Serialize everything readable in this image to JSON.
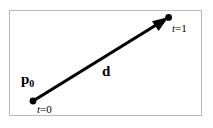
{
  "figure": {
    "type": "vector-ray-diagram",
    "frame": {
      "border_color": "#b9b9bd",
      "background_color": "#ffffff"
    },
    "stroke_color": "#000000",
    "labels": {
      "origin_point": "p",
      "origin_subscript": "0",
      "direction_vector": "d",
      "parameter_start": "t",
      "parameter_start_equals": "=0",
      "parameter_end": "t",
      "parameter_end_equals": "=1"
    },
    "geometry": {
      "start_point": {
        "x": 33,
        "y": 101
      },
      "end_point": {
        "x": 168,
        "y": 18
      },
      "line_width": 3
    }
  }
}
